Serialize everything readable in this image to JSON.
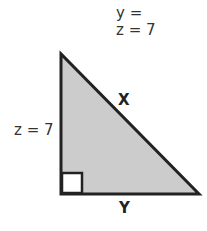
{
  "header": {
    "line1": "y =",
    "line2": "z = 7"
  },
  "triangle": {
    "fill_color": "#cccccc",
    "stroke_color": "#222222",
    "side_left_label": "z = 7",
    "hypotenuse_label": "X",
    "base_label": "Y",
    "right_angle_marker": "square"
  }
}
